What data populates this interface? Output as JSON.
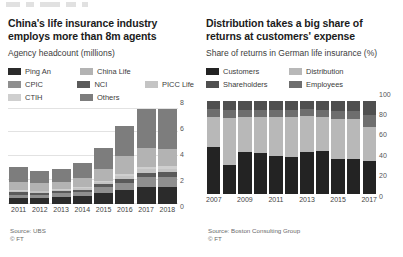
{
  "page": {
    "background": "#ffffff"
  },
  "palette": {
    "ping_an": "#2b2b2b",
    "cpic": "#8f8f8f",
    "ctih": "#cfcfcf",
    "china_life": "#b3b3b3",
    "nci": "#5a5a5a",
    "picc_life": "#c4c4c4",
    "others": "#7d7d7d",
    "customers": "#232323",
    "distribution": "#b8b8b8",
    "shareholders": "#4f4f4f",
    "employees": "#6e6e6e",
    "grid": "#e2e2e2",
    "axis_text": "#555555"
  },
  "left_panel": {
    "title": "China's life insurance industry employs more than 8m agents",
    "subtitle": "Agency headcount (millions)",
    "legend": [
      {
        "label": "Ping An",
        "color": "#2b2b2b"
      },
      {
        "label": "China Life",
        "color": "#b3b3b3"
      },
      {
        "label": "CPIC",
        "color": "#8f8f8f"
      },
      {
        "label": "NCI",
        "color": "#5a5a5a"
      },
      {
        "label": "PICC Life",
        "color": "#c4c4c4"
      },
      {
        "label": "CTIH",
        "color": "#cfcfcf"
      },
      {
        "label": "Others",
        "color": "#7d7d7d"
      }
    ],
    "source": "Source: UBS",
    "copyright": "© FT"
  },
  "right_panel": {
    "title": "Distribution takes a big share of returns at customers' expense",
    "subtitle": "Share of returns in German life insurance (%)",
    "legend": [
      {
        "label": "Customers",
        "color": "#232323"
      },
      {
        "label": "Distribution",
        "color": "#b8b8b8"
      },
      {
        "label": "Shareholders",
        "color": "#4f4f4f"
      },
      {
        "label": "Employees",
        "color": "#6e6e6e"
      }
    ],
    "source": "Source: Boston Consulting Group",
    "copyright": "© FT"
  },
  "chart_data": [
    {
      "type": "bar",
      "stacked": true,
      "title": "China's life insurance industry employs more than 8m agents",
      "subtitle": "Agency headcount (millions)",
      "xlabel": "",
      "ylabel": "Agency headcount (millions)",
      "ylim": [
        0,
        8
      ],
      "yticks": [
        0,
        2,
        4,
        6,
        8
      ],
      "grid": true,
      "legend_position": "top",
      "categories": [
        "2011",
        "2012",
        "2013",
        "2014",
        "2015",
        "2016",
        "2017",
        "2018"
      ],
      "series": [
        {
          "name": "Ping An",
          "color": "#2b2b2b",
          "values": [
            0.48,
            0.49,
            0.56,
            0.63,
            0.87,
            1.1,
            1.39,
            1.42
          ]
        },
        {
          "name": "CPIC",
          "color": "#8f8f8f",
          "values": [
            0.28,
            0.26,
            0.29,
            0.35,
            0.48,
            0.65,
            0.87,
            0.84
          ]
        },
        {
          "name": "China Life",
          "color": "#b3b3b3",
          "values": [
            0.7,
            0.69,
            0.65,
            0.74,
            0.98,
            1.5,
            1.58,
            1.44
          ]
        },
        {
          "name": "NCI",
          "color": "#5a5a5a",
          "values": [
            0.18,
            0.16,
            0.17,
            0.2,
            0.26,
            0.33,
            0.35,
            0.37
          ]
        },
        {
          "name": "PICC Life",
          "color": "#c4c4c4",
          "values": [
            0.12,
            0.11,
            0.12,
            0.15,
            0.2,
            0.26,
            0.3,
            0.31
          ]
        },
        {
          "name": "CTIH",
          "color": "#cfcfcf",
          "values": [
            0.05,
            0.05,
            0.06,
            0.07,
            0.1,
            0.14,
            0.17,
            0.18
          ]
        },
        {
          "name": "Others",
          "color": "#7d7d7d",
          "values": [
            1.24,
            0.94,
            1.05,
            1.26,
            1.76,
            2.52,
            3.34,
            3.44
          ]
        }
      ],
      "totals": [
        3.05,
        2.7,
        2.9,
        3.4,
        4.65,
        6.5,
        8.0,
        8.0
      ]
    },
    {
      "type": "bar",
      "stacked": true,
      "stack_percent": true,
      "title": "Distribution takes a big share of returns at customers' expense",
      "subtitle": "Share of returns in German life insurance (%)",
      "xlabel": "",
      "ylabel": "Share of returns (%)",
      "ylim": [
        0,
        100
      ],
      "yticks": [
        0,
        20,
        40,
        60,
        80,
        100
      ],
      "grid": false,
      "legend_position": "top",
      "categories": [
        "2007",
        "2008",
        "2009",
        "2010",
        "2011",
        "2012",
        "2013",
        "2014",
        "2015",
        "2016",
        "2017"
      ],
      "tick_labels": [
        "2007",
        "",
        "2009",
        "",
        "2011",
        "",
        "2013",
        "",
        "2015",
        "",
        "2017"
      ],
      "series": [
        {
          "name": "Customers",
          "color": "#232323",
          "values": [
            50,
            31,
            45,
            44,
            40,
            39,
            45,
            46,
            37,
            37,
            35
          ]
        },
        {
          "name": "Distribution",
          "color": "#b8b8b8",
          "values": [
            32,
            50,
            37,
            38,
            42,
            43,
            38,
            36,
            43,
            43,
            36
          ]
        },
        {
          "name": "Shareholders",
          "color": "#4f4f4f",
          "values": [
            9,
            10,
            10,
            10,
            10,
            10,
            9,
            10,
            11,
            11,
            16
          ]
        },
        {
          "name": "Employees",
          "color": "#6e6e6e",
          "values": [
            9,
            9,
            8,
            8,
            8,
            8,
            8,
            8,
            9,
            9,
            13
          ]
        }
      ]
    }
  ]
}
